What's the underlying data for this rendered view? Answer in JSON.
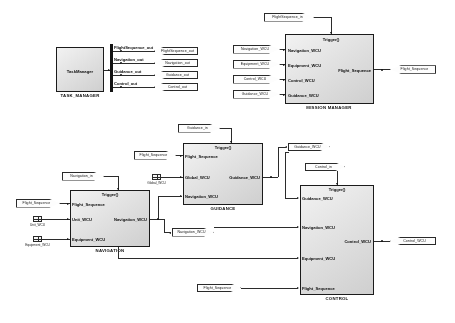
{
  "diagram": {
    "signal_names": {
      "flight_sequence": "Flight_Sequence",
      "navigation_wcu": "Navigation_WCU",
      "equipment_wcu": "Equipment_WCU",
      "control_wcu": "Control_WCU",
      "guidance_wcu": "Guidance_WCU",
      "global_wcu": "Global_WCU",
      "unit_wcu": "Unit_WCU",
      "trigger": "Trigger()"
    }
  },
  "task_manager": {
    "block_label": "TaskManager",
    "caption": "TASK_MANAGER",
    "bus_outputs": [
      {
        "signal": "FlightSequence_out",
        "tag": "FlightSequence_out"
      },
      {
        "signal": "Navigation_out",
        "tag": "Navigation_out"
      },
      {
        "signal": "Guidance_out",
        "tag": "Guidance_out"
      },
      {
        "signal": "Control_out",
        "tag": "Control_out"
      }
    ]
  },
  "mission_manager": {
    "caption": "MISSION MANAGER",
    "trigger_label": "Trigger()",
    "trigger_source": "FlightSequence_in",
    "inputs": [
      {
        "label": "Navigation_WCU",
        "port": "Navigation_WCU"
      },
      {
        "label": "Equipment_WCU",
        "port": "Equipment_WCU"
      },
      {
        "label": "Control_WCU",
        "port": "Control_WCU"
      },
      {
        "label": "Guidance_WCU",
        "port": "Guidance_WCU"
      }
    ],
    "outputs": [
      {
        "label": "Flight_Sequence",
        "port": "Flight_Sequence"
      }
    ]
  },
  "guidance": {
    "caption": "GUIDANCE",
    "trigger_label": "Trigger()",
    "trigger_source": "Guidance_in",
    "inputs": [
      {
        "label": "Flight_Sequence",
        "port": "Flight_Sequence",
        "kind": "inport"
      },
      {
        "label": "Global_WCU",
        "port": "Global_WCU",
        "kind": "from"
      },
      {
        "label": "Navigation_WCU",
        "port": "",
        "kind": "wire"
      }
    ],
    "outputs": [
      {
        "label": "Guidance_WCU",
        "port": "Guidance_WCU"
      }
    ]
  },
  "navigation": {
    "caption": "NAVIGATION",
    "trigger_label": "Trigger()",
    "trigger_source": "Navigation_in",
    "inputs": [
      {
        "label": "Flight_Sequence",
        "port": "Flight_Sequence",
        "kind": "inport"
      },
      {
        "label": "Unit_WCU",
        "port": "Unit_WCU",
        "kind": "from"
      },
      {
        "label": "Equipment_WCU",
        "port": "Equipment_WCU",
        "kind": "from"
      }
    ],
    "outputs": [
      {
        "label": "Navigation_WCU",
        "port": "Navigation_WCU"
      }
    ]
  },
  "control": {
    "caption": "CONTROL",
    "trigger_label": "Trigger()",
    "trigger_source": "Control_in",
    "inputs": [
      {
        "label": "Guidance_WCU",
        "port": ""
      },
      {
        "label": "Navigation_WCU",
        "port": ""
      },
      {
        "label": "Equipment_WCU",
        "port": ""
      },
      {
        "label": "Flight_Sequence",
        "port": "Flight_Sequence"
      }
    ],
    "outputs": [
      {
        "label": "Control_WCU",
        "port": "Control_WCU"
      }
    ]
  }
}
